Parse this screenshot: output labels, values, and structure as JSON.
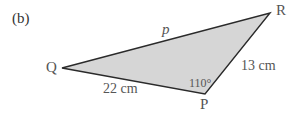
{
  "figure": {
    "part_label": "(b)",
    "vertices": {
      "Q": {
        "label": "Q",
        "x": 62,
        "y": 68
      },
      "R": {
        "label": "R",
        "x": 270,
        "y": 13
      },
      "P": {
        "label": "P",
        "x": 205,
        "y": 94
      }
    },
    "sides": {
      "QP": "22 cm",
      "PR": "13 cm",
      "QR": "p"
    },
    "angle_P": "110°",
    "colors": {
      "fill": "#d6d6d6",
      "stroke": "#2a2a2a",
      "text": "#555555"
    }
  }
}
